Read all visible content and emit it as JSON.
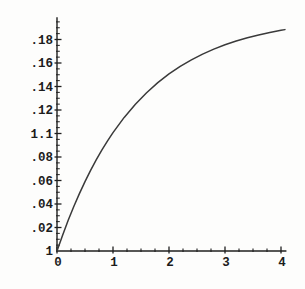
{
  "figure": {
    "background_color": "#fdfdfc",
    "axis_color": "#1f1f1f",
    "curve_color": "#3a3a3a",
    "label_color": "#1c1c1c"
  },
  "chart_data": {
    "type": "line",
    "title": "",
    "xlabel": "",
    "ylabel": "",
    "legend": "none",
    "grid": false,
    "xlim": [
      0,
      4.07
    ],
    "ylim": [
      0,
      0.199
    ],
    "x_ticks": [
      {
        "value": 0,
        "label": "0"
      },
      {
        "value": 1,
        "label": "1"
      },
      {
        "value": 2,
        "label": "2"
      },
      {
        "value": 3,
        "label": "3"
      },
      {
        "value": 4,
        "label": "4"
      }
    ],
    "x_minor_tick_step": 0.25,
    "y_ticks": [
      {
        "value": 0.18,
        "label": ".18"
      },
      {
        "value": 0.16,
        "label": ".16"
      },
      {
        "value": 0.14,
        "label": ".14"
      },
      {
        "value": 0.12,
        "label": ".12"
      },
      {
        "value": 0.1,
        "label": "1.1"
      },
      {
        "value": 0.08,
        "label": ".08"
      },
      {
        "value": 0.06,
        "label": ".06"
      },
      {
        "value": 0.04,
        "label": ".04"
      },
      {
        "value": 0.02,
        "label": ".02"
      },
      {
        "value": 0.0,
        "label": "1"
      }
    ],
    "y_minor_tick_step": 0.005,
    "series": [
      {
        "name": "saturating-curve",
        "approx_function": "y = 0.2*(1 - exp(-0.7*x))",
        "x": [
          0,
          0.1,
          0.2,
          0.3,
          0.4,
          0.5,
          0.6,
          0.7,
          0.8,
          0.9,
          1.0,
          1.2,
          1.4,
          1.6,
          1.8,
          2.0,
          2.2,
          2.4,
          2.6,
          2.8,
          3.0,
          3.2,
          3.4,
          3.6,
          3.8,
          4.0,
          4.07
        ],
        "y": [
          0,
          0.0135,
          0.0261,
          0.0379,
          0.0488,
          0.0591,
          0.0686,
          0.0775,
          0.0858,
          0.0935,
          0.1007,
          0.1137,
          0.1249,
          0.1347,
          0.1433,
          0.1507,
          0.1571,
          0.1627,
          0.1676,
          0.1718,
          0.1755,
          0.1787,
          0.1815,
          0.1839,
          0.186,
          0.1878,
          0.1884
        ]
      }
    ]
  }
}
